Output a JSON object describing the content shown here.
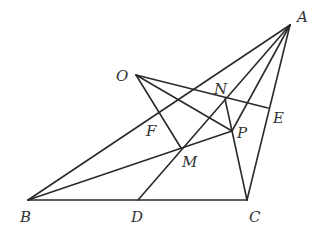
{
  "diagram": {
    "type": "geometry-figure",
    "points": {
      "A": {
        "x": 290,
        "y": 25,
        "label": "A",
        "lx": 297,
        "ly": 22
      },
      "B": {
        "x": 28,
        "y": 200,
        "label": "B",
        "lx": 20,
        "ly": 222
      },
      "C": {
        "x": 247,
        "y": 200,
        "label": "C",
        "lx": 249,
        "ly": 222
      },
      "D": {
        "x": 138,
        "y": 200,
        "label": "D",
        "lx": 131,
        "ly": 222
      },
      "E": {
        "x": 268,
        "y": 108,
        "label": "E",
        "lx": 273,
        "ly": 123
      },
      "F": {
        "x": 159,
        "y": 111,
        "label": "F",
        "lx": 146,
        "ly": 136
      },
      "M": {
        "x": 181,
        "y": 148,
        "label": "M",
        "lx": 182,
        "ly": 167
      },
      "N": {
        "x": 225,
        "y": 99,
        "label": "N",
        "lx": 214,
        "ly": 94
      },
      "O": {
        "x": 136,
        "y": 75,
        "label": "O",
        "lx": 116,
        "ly": 81
      },
      "P": {
        "x": 232,
        "y": 131,
        "label": "P",
        "lx": 237,
        "ly": 138
      }
    },
    "segments": [
      [
        "A",
        "B"
      ],
      [
        "A",
        "C"
      ],
      [
        "B",
        "C"
      ],
      [
        "A",
        "D"
      ],
      [
        "A",
        "P"
      ],
      [
        "B",
        "P"
      ],
      [
        "O",
        "E"
      ],
      [
        "O",
        "P"
      ],
      [
        "O",
        "M"
      ],
      [
        "N",
        "P"
      ],
      [
        "P",
        "C"
      ]
    ]
  }
}
